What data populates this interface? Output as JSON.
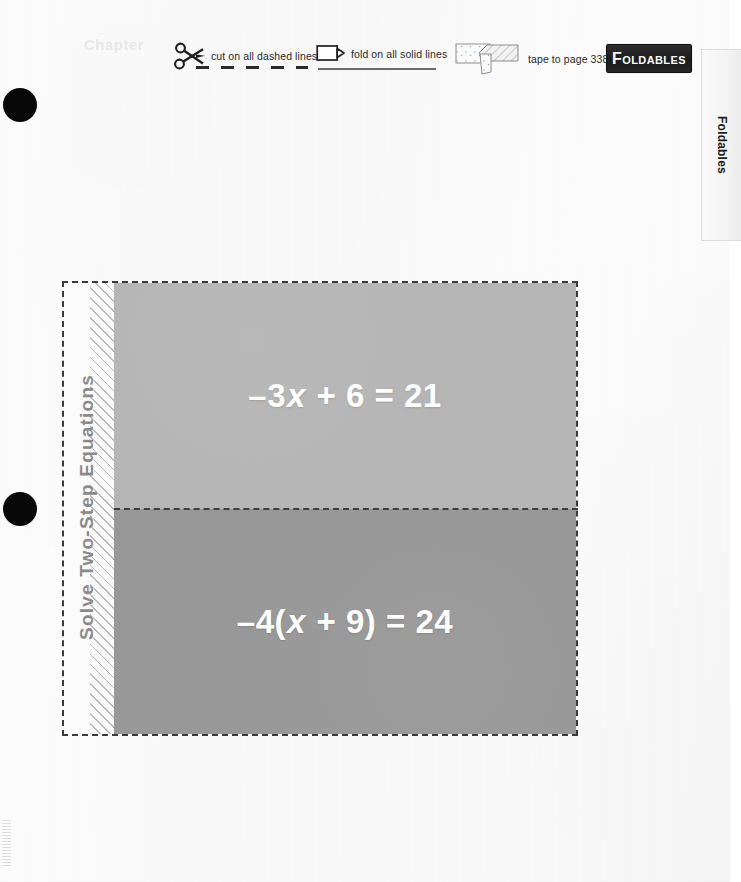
{
  "page": {
    "background_color": "#fdfdfd",
    "ghost_artifact_text": "Chapter"
  },
  "header": {
    "cut": {
      "icon": "scissors-icon",
      "label": "cut on all dashed lines"
    },
    "fold": {
      "icon": "fold-paper-icon",
      "label": "fold on all solid lines"
    },
    "tape": {
      "icon": "tape-strip-icon",
      "label": "tape to page 338"
    },
    "badge": {
      "text_lead": "F",
      "text_rest": "OLDABLES",
      "full_text": "FOLDABLES",
      "background_color": "#1b1b1b",
      "text_color": "#ffffff"
    }
  },
  "side_tab": {
    "label": "Foldables"
  },
  "punch_marks": {
    "count": 2,
    "color": "#080808"
  },
  "foldable": {
    "spine_title": "Solve Two-Step Equations",
    "spine_title_color": "#8a8a8a",
    "cut_line_style": "dashed",
    "cut_line_color": "#3a3a3a",
    "panels": [
      {
        "name": "top-flap",
        "equation_plain": "-3x + 6 = 21",
        "eq_pre": "–3",
        "eq_var": "x",
        "eq_post": " + 6 = 21",
        "fill_color": "#b5b5b5",
        "text_color": "#ffffff"
      },
      {
        "name": "bottom-flap",
        "equation_plain": "-4(x + 9) = 24",
        "eq_pre": "–4(",
        "eq_var": "x",
        "eq_post": " + 9) = 24",
        "fill_color": "#989898",
        "text_color": "#ffffff"
      }
    ]
  }
}
